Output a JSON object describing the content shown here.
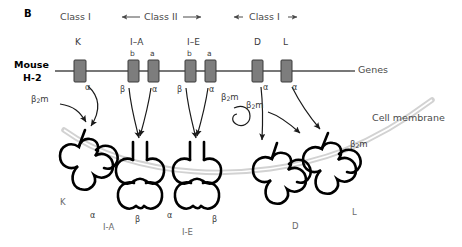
{
  "figure": {
    "panel_letter": "B",
    "organism_line1": "Mouse",
    "organism_line2": "H-2",
    "genes_label": "Genes",
    "membrane_label": "Cell membrane",
    "colors": {
      "gene_box_fill": "#7d7d7d",
      "gene_box_stroke": "#3a3a3a",
      "gene_line": "#4a4a4a",
      "membrane": "#d2d2d2",
      "protein_stroke": "#000000",
      "text": "#3a3a3a",
      "label_gray": "#6a6a6a"
    }
  },
  "class_headers": [
    {
      "label": "Class I",
      "arrows": "none",
      "x": 60,
      "y": 14
    },
    {
      "label": "Class II",
      "arrows": "both",
      "x": 133,
      "y": 14
    },
    {
      "label": "Class I",
      "arrows": "both",
      "x": 238,
      "y": 14
    }
  ],
  "gene_loci": [
    {
      "name": "K",
      "x": 74,
      "subunits": [
        {
          "label": "",
          "x": 74,
          "chain": "α"
        }
      ]
    },
    {
      "name": "I–A",
      "x": 128,
      "subunits": [
        {
          "label": "b",
          "x": 128,
          "chain": "β"
        },
        {
          "label": "a",
          "x": 148,
          "chain": "α"
        }
      ]
    },
    {
      "name": "I–E",
      "x": 185,
      "subunits": [
        {
          "label": "b",
          "x": 185,
          "chain": "β"
        },
        {
          "label": "a",
          "x": 205,
          "chain": "α"
        }
      ]
    },
    {
      "name": "D",
      "x": 252,
      "subunits": [
        {
          "label": "",
          "x": 252,
          "chain": "α"
        }
      ]
    },
    {
      "name": "L",
      "x": 280,
      "subunits": [
        {
          "label": "",
          "x": 280,
          "chain": "α"
        }
      ]
    }
  ],
  "chain_annotations": [
    {
      "text": "α",
      "x": 88,
      "y": 90
    },
    {
      "text": "β",
      "x": 124,
      "y": 92
    },
    {
      "text": "α",
      "x": 152,
      "y": 92
    },
    {
      "text": "β",
      "x": 181,
      "y": 92
    },
    {
      "text": "α",
      "x": 209,
      "y": 92
    },
    {
      "text": "α",
      "x": 262,
      "y": 90
    },
    {
      "text": "α",
      "x": 291,
      "y": 90
    }
  ],
  "b2m_annotations": [
    {
      "x": 34,
      "y": 101
    },
    {
      "x": 224,
      "y": 99
    },
    {
      "x": 249,
      "y": 107
    },
    {
      "x": 348,
      "y": 145
    }
  ],
  "b2m_text": {
    "greek": "β",
    "subscript": "2",
    "suffix": "m"
  },
  "proteins": [
    {
      "name": "K",
      "label_x": 62,
      "label_y": 203,
      "chains": []
    },
    {
      "name": "I-A",
      "label_x": 108,
      "label_y": 228,
      "chains": [
        {
          "text": "α",
          "x": 93,
          "y": 217
        },
        {
          "text": "β",
          "x": 138,
          "y": 222
        }
      ]
    },
    {
      "name": "I-E",
      "label_x": 186,
      "label_y": 233,
      "chains": [
        {
          "text": "α",
          "x": 170,
          "y": 217
        },
        {
          "text": "β",
          "x": 215,
          "y": 222
        }
      ]
    },
    {
      "name": "D",
      "label_x": 294,
      "label_y": 227,
      "chains": []
    },
    {
      "name": "L",
      "label_x": 354,
      "label_y": 213,
      "chains": []
    }
  ]
}
